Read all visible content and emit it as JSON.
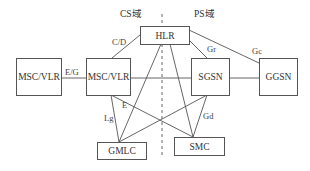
{
  "diagram": {
    "domains": [
      {
        "id": "cs",
        "label": "CS域"
      },
      {
        "id": "ps",
        "label": "PS域"
      }
    ],
    "nodes": [
      {
        "id": "msc_vlr_remote",
        "label": "MSC/VLR"
      },
      {
        "id": "msc_vlr",
        "label": "MSC/VLR"
      },
      {
        "id": "hlr",
        "label": "HLR"
      },
      {
        "id": "sgsn",
        "label": "SGSN"
      },
      {
        "id": "ggsn",
        "label": "GGSN"
      },
      {
        "id": "gmlc",
        "label": "GMLC"
      },
      {
        "id": "smc",
        "label": "SMC"
      }
    ],
    "edges": [
      {
        "from": "msc_vlr_remote",
        "to": "msc_vlr",
        "label": "E/G"
      },
      {
        "from": "msc_vlr",
        "to": "hlr",
        "label": "C/D"
      },
      {
        "from": "msc_vlr",
        "to": "sgsn",
        "label": ""
      },
      {
        "from": "sgsn",
        "to": "ggsn",
        "label": ""
      },
      {
        "from": "hlr",
        "to": "sgsn",
        "label": "Gr"
      },
      {
        "from": "hlr",
        "to": "ggsn",
        "label": "Gc"
      },
      {
        "from": "hlr",
        "to": "gmlc",
        "label": ""
      },
      {
        "from": "hlr",
        "to": "smc",
        "label": ""
      },
      {
        "from": "msc_vlr",
        "to": "gmlc",
        "label": "Lg"
      },
      {
        "from": "msc_vlr",
        "to": "smc",
        "label": "E"
      },
      {
        "from": "sgsn",
        "to": "gmlc",
        "label": ""
      },
      {
        "from": "sgsn",
        "to": "smc",
        "label": "Gd"
      }
    ],
    "edge_labels": {
      "eg": "E/G",
      "cd": "C/D",
      "gr": "Gr",
      "gc": "Gc",
      "lg": "Lg",
      "e": "E",
      "gd": "Gd"
    },
    "divider": "CS/PS domain boundary (dashed)"
  }
}
